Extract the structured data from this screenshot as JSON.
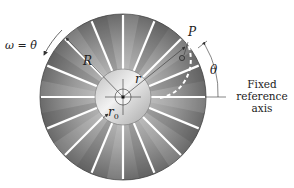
{
  "diagram": {
    "labels": {
      "omega": "ω = θ̇",
      "R": "R",
      "r": "r",
      "r0": "r",
      "r0_sub": "0",
      "P": "P",
      "theta": "θ"
    },
    "reference_axis": [
      "Fixed",
      "reference",
      "axis"
    ],
    "slot_count": 16,
    "colors": {
      "disc_dark": "#6e6e6e",
      "disc_light": "#d8d8d8",
      "hub": "#e6e6e6",
      "slot": "#ffffff",
      "line": "#333333",
      "path_dash": "#ffffff"
    }
  }
}
